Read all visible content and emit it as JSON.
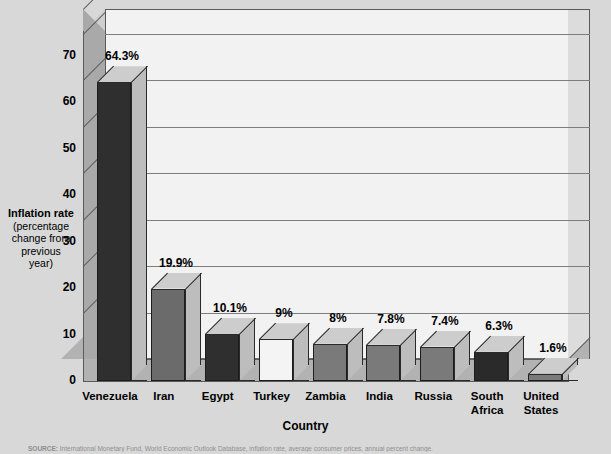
{
  "chart_data": {
    "type": "bar",
    "title": "",
    "subtitle": "",
    "xlabel": "Country",
    "ylabel": "Inflation rate (percentage change from previous year)",
    "ylabel_lines": [
      "Inflation rate",
      "(percentage",
      "change from",
      "previous",
      "year)"
    ],
    "categories": [
      "Venezuela",
      "Iran",
      "Egypt",
      "Turkey",
      "Zambia",
      "India",
      "Russia",
      "South Africa",
      "United States"
    ],
    "category_lines": [
      [
        "Venezuela"
      ],
      [
        "Iran"
      ],
      [
        "Egypt"
      ],
      [
        "Turkey"
      ],
      [
        "Zambia"
      ],
      [
        "India"
      ],
      [
        "Russia"
      ],
      [
        "South",
        "Africa"
      ],
      [
        "United",
        "States"
      ]
    ],
    "values": [
      64.3,
      19.9,
      10.1,
      9,
      8,
      7.8,
      7.4,
      6.3,
      1.6
    ],
    "data_labels": [
      "64.3%",
      "19.9%",
      "10.1%",
      "9%",
      "8%",
      "7.8%",
      "7.4%",
      "6.3%",
      "1.6%"
    ],
    "bar_colors": [
      "#2f2f2f",
      "#6b6b6b",
      "#2f2f2f",
      "#f4f4f4",
      "#7a7a7a",
      "#7a7a7a",
      "#7a7a7a",
      "#2a2a2a",
      "#7a7a7a"
    ],
    "yticks": [
      0,
      10,
      20,
      30,
      40,
      50,
      60,
      70
    ],
    "ytick_labels": [
      "0",
      "10",
      "20",
      "30",
      "40",
      "50",
      "60",
      "70"
    ],
    "ylim": [
      0,
      75.3
    ],
    "grid": true,
    "legend": "none",
    "style": "3d-column"
  },
  "axis": {
    "y_title_line1": "Inflation rate",
    "y_title_line2": "(percentage",
    "y_title_line3": "change from",
    "y_title_line4": "previous",
    "y_title_line5": "year)",
    "x_title": "Country"
  },
  "colors": {
    "page_background": "#d8d8d8",
    "plot_back_wall": "#f2f2f2",
    "plot_left_wall": "#a9a9a9",
    "plot_floor": "#b2b2b2",
    "gridline": "#7d7d7d",
    "bar_dark": "#2f2f2f",
    "bar_medium": "#7a7a7a",
    "bar_light": "#f4f4f4",
    "bar_top_face": "#cdcdcd",
    "bar_side_face": "#bdbdbd"
  },
  "source": {
    "prefix": "SOURCE:",
    "text": "International Monetary Fund, World Economic Outlook Database, inflation rate, average consumer prices, annual percent change."
  }
}
